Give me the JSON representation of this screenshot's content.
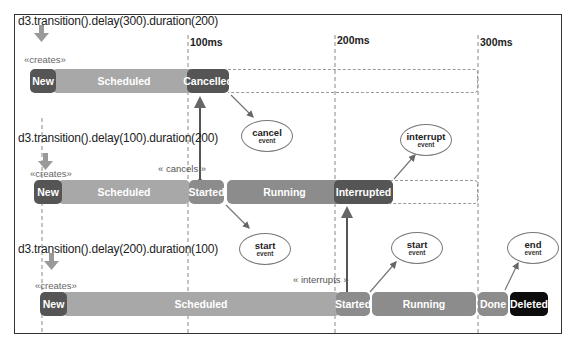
{
  "timeline": {
    "ticks": [
      {
        "label": "100ms",
        "x": 188
      },
      {
        "label": "200ms",
        "x": 335
      },
      {
        "label": "300ms",
        "x": 478
      }
    ]
  },
  "transitions": [
    {
      "code": "d3.transition().delay(300).duration(200)",
      "creates_label": "«creates»",
      "states": [
        {
          "label": "New",
          "style": "dark"
        },
        {
          "label": "Scheduled",
          "style": "light"
        },
        {
          "label": "Cancelled",
          "style": "dark"
        }
      ],
      "event": {
        "title": "cancel",
        "subtitle": "event"
      }
    },
    {
      "code": "d3.transition().delay(100).duration(200)",
      "creates_label": "«creates»",
      "relation_label": "« cancels »",
      "states": [
        {
          "label": "New",
          "style": "dark"
        },
        {
          "label": "Scheduled",
          "style": "light"
        },
        {
          "label": "Started",
          "style": "mid"
        },
        {
          "label": "Running",
          "style": "mid"
        },
        {
          "label": "Interrupted",
          "style": "dark"
        }
      ],
      "events": [
        {
          "title": "start",
          "subtitle": "event"
        },
        {
          "title": "interrupt",
          "subtitle": "event"
        }
      ]
    },
    {
      "code": "d3.transition().delay(200).duration(100)",
      "creates_label": "«creates»",
      "relation_label": "« interrupts »",
      "states": [
        {
          "label": "New",
          "style": "dark"
        },
        {
          "label": "Scheduled",
          "style": "light"
        },
        {
          "label": "Started",
          "style": "mid"
        },
        {
          "label": "Running",
          "style": "mid"
        },
        {
          "label": "Done",
          "style": "mid"
        },
        {
          "label": "Deleted",
          "style": "black"
        }
      ],
      "events": [
        {
          "title": "start",
          "subtitle": "event"
        },
        {
          "title": "end",
          "subtitle": "event"
        }
      ]
    }
  ],
  "colors": {
    "dark_state": "#555555",
    "light_state": "#a8a8a8",
    "mid_state": "#8c8c8c",
    "deleted_state": "#0c0c0c",
    "frame": "#333333"
  }
}
